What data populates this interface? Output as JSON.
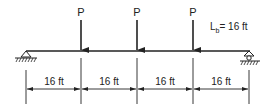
{
  "diagram": {
    "type": "simply-supported-beam",
    "loads": [
      {
        "label": "P",
        "x": 81
      },
      {
        "label": "P",
        "x": 137
      },
      {
        "label": "P",
        "x": 193
      }
    ],
    "unbraced_length": {
      "symbol": "L",
      "subscript": "b",
      "value": "= 16 ft"
    },
    "spans": [
      {
        "label": "16 ft"
      },
      {
        "label": "16 ft"
      },
      {
        "label": "16 ft"
      },
      {
        "label": "16 ft"
      }
    ],
    "supports": {
      "left": "pin",
      "right": "roller"
    },
    "colors": {
      "line": "#222222",
      "background": "#ffffff"
    }
  }
}
